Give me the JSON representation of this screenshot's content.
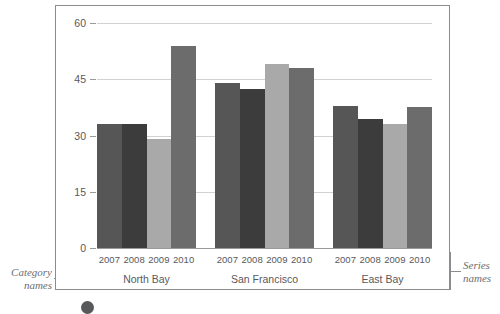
{
  "annotations": {
    "category_names": "Category\nnames",
    "category_names_line1": "Category",
    "category_names_line2": "names",
    "series_names_line1": "Series",
    "series_names_line2": "names"
  },
  "chart_data": {
    "type": "bar",
    "title": "",
    "xlabel": "",
    "ylabel": "",
    "ylim": [
      0,
      60
    ],
    "yticks": [
      0,
      15,
      30,
      45,
      60
    ],
    "ytick_labels": [
      "0",
      "15",
      "30",
      "45",
      "60"
    ],
    "grid": true,
    "legend_position": "none",
    "grouped": true,
    "categories": [
      "North Bay",
      "San Francisco",
      "East Bay"
    ],
    "series": [
      {
        "name": "2007",
        "color": "#565656",
        "values": [
          33,
          44,
          38
        ]
      },
      {
        "name": "2008",
        "color": "#3c3c3c",
        "values": [
          33,
          42.5,
          34.5
        ]
      },
      {
        "name": "2009",
        "color": "#a9a9a9",
        "values": [
          29,
          49,
          33
        ]
      },
      {
        "name": "2010",
        "color": "#6c6c6c",
        "values": [
          54,
          48,
          37.5
        ]
      }
    ],
    "groups": [
      {
        "label": "North Bay",
        "bars": [
          {
            "series": "2007",
            "value": 33,
            "color": "#565656"
          },
          {
            "series": "2008",
            "value": 33,
            "color": "#3c3c3c"
          },
          {
            "series": "2009",
            "value": 29,
            "color": "#a9a9a9"
          },
          {
            "series": "2010",
            "value": 54,
            "color": "#6c6c6c"
          }
        ]
      },
      {
        "label": "San Francisco",
        "bars": [
          {
            "series": "2007",
            "value": 44,
            "color": "#565656"
          },
          {
            "series": "2008",
            "value": 42.5,
            "color": "#3c3c3c"
          },
          {
            "series": "2009",
            "value": 49,
            "color": "#a9a9a9"
          },
          {
            "series": "2010",
            "value": 48,
            "color": "#6c6c6c"
          }
        ]
      },
      {
        "label": "East Bay",
        "bars": [
          {
            "series": "2007",
            "value": 38,
            "color": "#565656"
          },
          {
            "series": "2008",
            "value": 34.5,
            "color": "#3c3c3c"
          },
          {
            "series": "2009",
            "value": 33,
            "color": "#a9a9a9"
          },
          {
            "series": "2010",
            "value": 37.5,
            "color": "#6c6c6c"
          }
        ]
      }
    ]
  },
  "colors": {
    "grid": "#d2d2d2",
    "axis": "#9a9a9a",
    "frame": "#8c8c8c",
    "text": "#58595b",
    "annotation_text": "#6d6e71"
  }
}
